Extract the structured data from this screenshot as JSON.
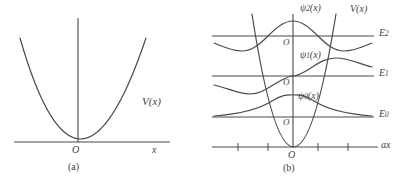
{
  "figure": {
    "background": "#ffffff",
    "line_color": "#4a4a4a",
    "text_color": "#3f3f3f"
  },
  "panel_a": {
    "caption": "(a)",
    "axis_x_label": "x",
    "origin_label": "O",
    "potential_label": "V(x)",
    "curve": {
      "type": "parabola",
      "description": "V(x) = k x^2, symmetric about origin, vertex at O",
      "vertex": [
        78,
        142
      ],
      "x_range": [
        20,
        146
      ],
      "top_y": 38
    },
    "axes": {
      "x_axis_y": 142,
      "x_axis_from": 14,
      "x_axis_to": 170,
      "y_axis_x": 78,
      "y_axis_from": 18,
      "y_axis_to": 142
    }
  },
  "panel_b": {
    "caption": "(b)",
    "axis_x_label": "ax",
    "origin_label": "O",
    "potential_label": "V(x)",
    "energy_levels": [
      {
        "name": "E_0",
        "label_base": "E",
        "label_sub": "0",
        "y": 117
      },
      {
        "name": "E_1",
        "label_base": "E",
        "label_sub": "1",
        "y": 76
      },
      {
        "name": "E_2",
        "label_base": "E",
        "label_sub": "2",
        "y": 36
      }
    ],
    "wavefunctions": [
      {
        "name": "psi_0",
        "label_base": "ψ",
        "label_sub": "0",
        "label_tail": "(x)",
        "nodes": 0,
        "parity": "even",
        "baseline_y": 117,
        "amplitude": 22,
        "description": "Gaussian ground state, single positive hump centered at O"
      },
      {
        "name": "psi_1",
        "label_base": "ψ",
        "label_sub": "1",
        "label_tail": "(x)",
        "nodes": 1,
        "parity": "odd",
        "baseline_y": 76,
        "amplitude": 18,
        "description": "First excited state, negative lobe left of O, positive lobe right of O"
      },
      {
        "name": "psi_2",
        "label_base": "ψ",
        "label_sub": "2",
        "label_tail": "(x)",
        "nodes": 2,
        "parity": "even",
        "baseline_y": 36,
        "amplitude": 18,
        "description": "Second excited state, central positive peak with two negative side lobes"
      }
    ],
    "origin_labels": [
      "O",
      "O",
      "O",
      "O"
    ],
    "ticks": {
      "count": 4,
      "positions": [
        238,
        268,
        318,
        348
      ]
    },
    "axes": {
      "x_axis_y": 147,
      "x_axis_from": 212,
      "x_axis_to": 378,
      "y_axis_x": 293,
      "y_axis_from": 14,
      "y_axis_to": 147
    },
    "curve": {
      "type": "parabola",
      "description": "Steep harmonic potential V(x), vertex at O on the ax axis",
      "vertex": [
        293,
        147
      ],
      "x_range": [
        252,
        336
      ],
      "top_y": 14
    }
  }
}
